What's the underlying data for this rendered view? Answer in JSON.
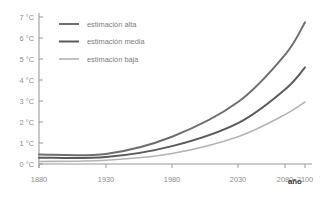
{
  "chart_data": {
    "type": "line",
    "title": "",
    "subtitle": "",
    "xlabel": "año",
    "ylabel": "",
    "grid": false,
    "legend_position": "top-left-inside",
    "x": [
      1880,
      1930,
      1980,
      2030,
      2080,
      2100
    ],
    "x_tick_labels": [
      "1880",
      "1930",
      "1980",
      "2030",
      "2080",
      "2100"
    ],
    "y_tick_labels": [
      "0 °C",
      "1 °C",
      "2 °C",
      "3 °C",
      "4 °C",
      "5 °C",
      "6 °C",
      "7 °C"
    ],
    "y_ticks": [
      0,
      1,
      2,
      3,
      4,
      5,
      6,
      7
    ],
    "xlim": [
      1880,
      2100
    ],
    "ylim": [
      0,
      7
    ],
    "units": "°C",
    "series": [
      {
        "name": "estimación alta",
        "color": "#6e6e6e",
        "width": 2.0,
        "values": [
          0.45,
          0.48,
          1.3,
          2.95,
          5.2,
          6.75
        ]
      },
      {
        "name": "estimación media",
        "color": "#5a5a5a",
        "width": 2.0,
        "values": [
          0.3,
          0.33,
          0.85,
          1.95,
          3.55,
          4.6
        ]
      },
      {
        "name": "estimación baja",
        "color": "#b4b4b4",
        "width": 1.6,
        "values": [
          0.12,
          0.18,
          0.5,
          1.3,
          2.35,
          2.95
        ]
      }
    ]
  },
  "legend": {
    "items": [
      {
        "label": "estimación alta"
      },
      {
        "label": "estimación media"
      },
      {
        "label": "estimación baja"
      }
    ]
  },
  "axis": {
    "x_title": "año"
  },
  "colors": {
    "background": "#ffffff",
    "axis": "#9a9a9a",
    "tick_text": "#8c8c8c",
    "axis_title_text": "#3a3a3a",
    "legend_text": "#7d7d7d"
  }
}
